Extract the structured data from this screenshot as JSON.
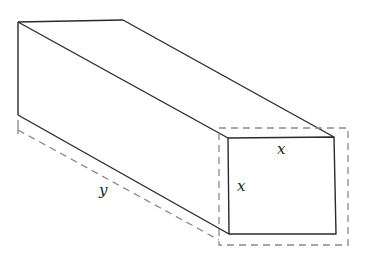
{
  "diagram": {
    "labels": {
      "front_top_edge": "x",
      "front_left_edge": "x",
      "length": "y"
    },
    "colors": {
      "edge": "#2a2a2a",
      "dashed": "#8a8a8a",
      "background": "#ffffff"
    }
  }
}
